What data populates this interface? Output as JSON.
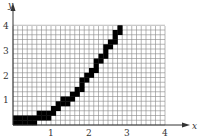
{
  "chart_data": {
    "type": "line",
    "title": "",
    "xlabel": "x",
    "ylabel": "y",
    "xlim": [
      0,
      4
    ],
    "ylim": [
      0,
      4
    ],
    "xticks": [
      "1",
      "2",
      "3",
      "4"
    ],
    "yticks": [
      "1",
      "2",
      "3",
      "4"
    ],
    "grid": true,
    "grid_cells_per_unit": 8,
    "series": [
      {
        "name": "y = x^2/2 (pixelated)",
        "x": [
          0,
          0.5,
          1.0,
          1.5,
          2.0,
          2.5,
          2.83
        ],
        "y": [
          0,
          0.125,
          0.5,
          1.125,
          2.0,
          3.125,
          4.0
        ]
      }
    ],
    "colors": {
      "grid": "#888888",
      "curve": "#000000",
      "axis": "#333333"
    }
  }
}
